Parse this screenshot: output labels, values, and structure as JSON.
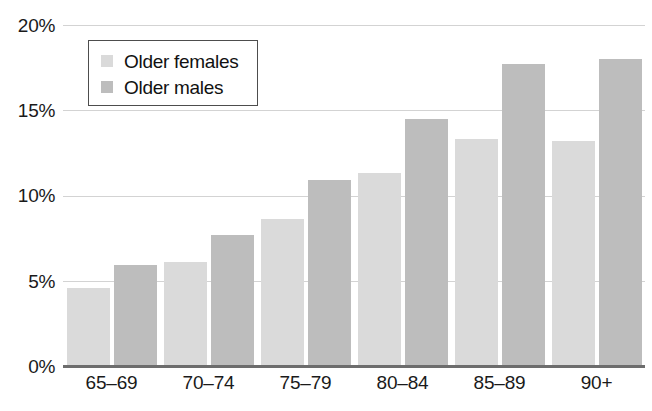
{
  "chart_data": {
    "type": "bar",
    "title": "",
    "subtitle": "",
    "xlabel": "",
    "ylabel": "",
    "categories": [
      "65–69",
      "70–74",
      "75–79",
      "80–84",
      "85–89",
      "90+"
    ],
    "series": [
      {
        "name": "Older females",
        "color": "#dadada",
        "values": [
          4.6,
          6.1,
          8.6,
          11.3,
          13.3,
          13.2
        ]
      },
      {
        "name": "Older males",
        "color": "#bdbdbd",
        "values": [
          5.9,
          7.7,
          10.9,
          14.5,
          17.7,
          18.0
        ]
      }
    ],
    "ylim": [
      0,
      20
    ],
    "yticks": [
      0,
      5,
      10,
      15,
      20
    ],
    "ytick_labels": [
      "0%",
      "5%",
      "10%",
      "15%",
      "20%"
    ],
    "grid": true,
    "grid_axis": "y",
    "legend_position": "upper left",
    "annotations": []
  },
  "legend": {
    "entries": [
      {
        "label": "Older females",
        "swatch": "legend-swatch-female"
      },
      {
        "label": "Older males",
        "swatch": "legend-swatch-male"
      }
    ]
  },
  "colors": {
    "female_bar": "#dadada",
    "male_bar": "#bdbdbd",
    "gridline": "#d3d3d3",
    "axis_line": "#6d6d6d",
    "text": "#1a1a1a",
    "legend_border": "#4d4d4d",
    "background": "#ffffff"
  }
}
